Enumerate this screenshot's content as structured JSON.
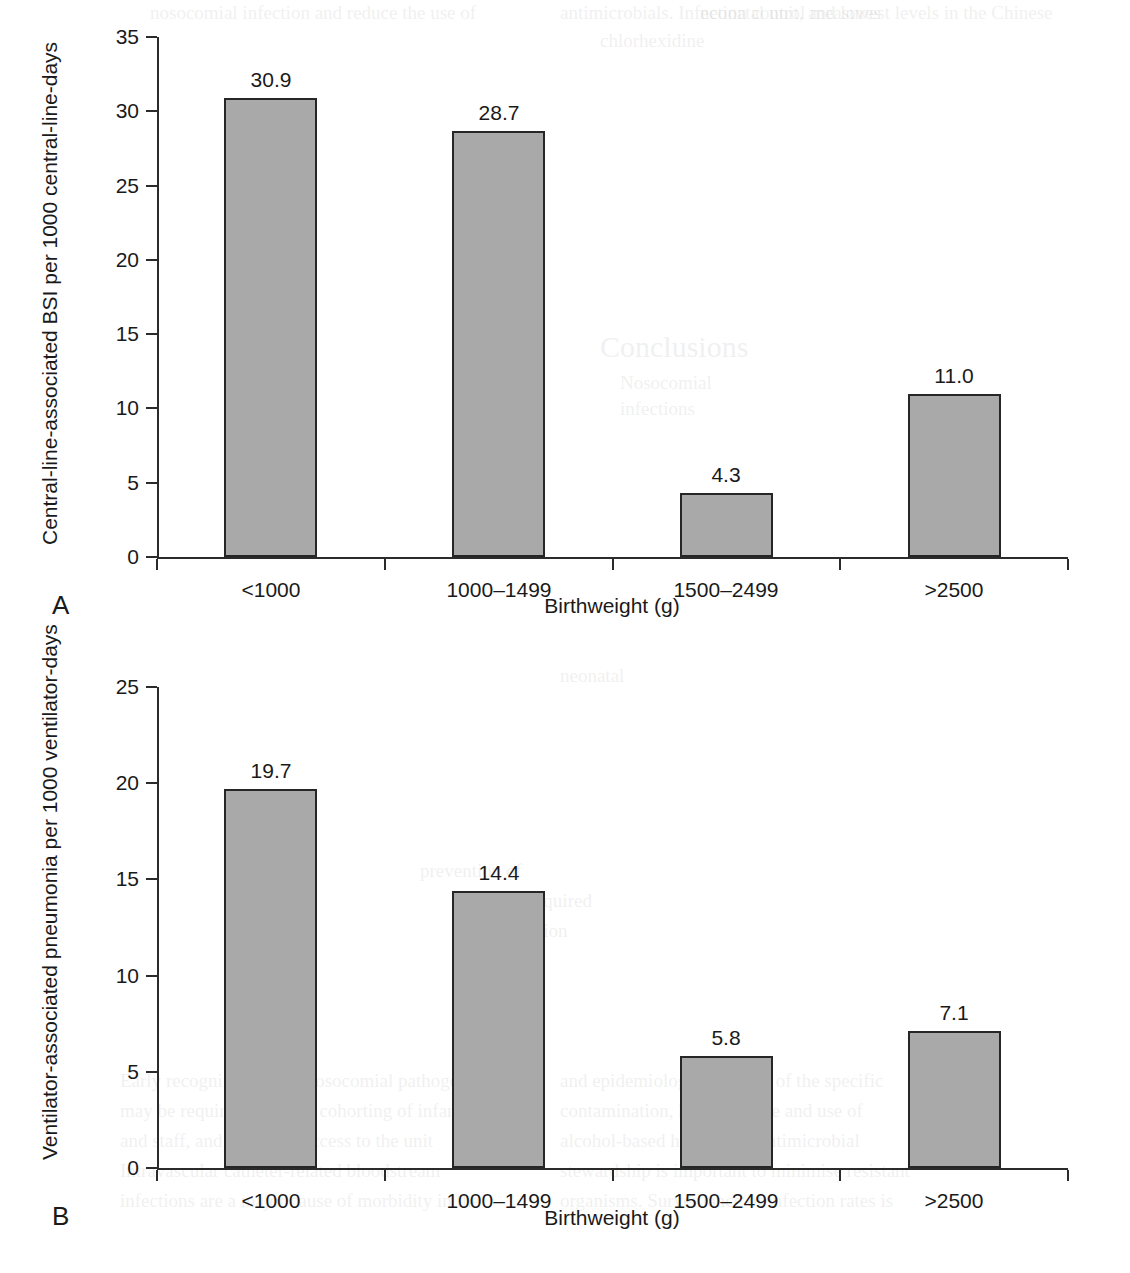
{
  "figure": {
    "panels": [
      {
        "letter": "A",
        "xlabel": "Birthweight (g)",
        "ylabel": "Central-line-associated BSI per 1000 central-line-days"
      },
      {
        "letter": "B",
        "xlabel": "Birthweight (g)",
        "ylabel": "Ventilator-associated pneumonia per 1000 ventilator-days"
      }
    ]
  },
  "chart_data": [
    {
      "type": "bar",
      "panel": "A",
      "title": "",
      "xlabel": "Birthweight (g)",
      "ylabel": "Central-line-associated BSI per 1000 central-line-days",
      "categories": [
        "<1000",
        "1000–1499",
        "1500–2499",
        ">2500"
      ],
      "values": [
        30.9,
        28.7,
        4.3,
        11.0
      ],
      "value_labels": [
        "30.9",
        "28.7",
        "4.3",
        "11.0"
      ],
      "ylim": [
        0,
        35
      ],
      "yticks": [
        0,
        5,
        10,
        15,
        20,
        25,
        30,
        35
      ],
      "ytick_labels": [
        "0",
        "5",
        "10",
        "15",
        "20",
        "25",
        "30",
        "35"
      ],
      "grid": false,
      "legend": null,
      "bar_color": "#a9a9a9",
      "bar_edge_color": "#262626"
    },
    {
      "type": "bar",
      "panel": "B",
      "title": "",
      "xlabel": "Birthweight (g)",
      "ylabel": "Ventilator-associated pneumonia per 1000 ventilator-days",
      "categories": [
        "<1000",
        "1000–1499",
        "1500–2499",
        ">2500"
      ],
      "values": [
        19.7,
        14.4,
        5.8,
        7.1
      ],
      "value_labels": [
        "19.7",
        "14.4",
        "5.8",
        "7.1"
      ],
      "ylim": [
        0,
        25
      ],
      "yticks": [
        0,
        5,
        10,
        15,
        20,
        25
      ],
      "ytick_labels": [
        "0",
        "5",
        "10",
        "15",
        "20",
        "25"
      ],
      "grid": false,
      "legend": null,
      "bar_color": "#a9a9a9",
      "bar_edge_color": "#262626"
    }
  ],
  "background_showthrough": [
    {
      "text": "nosocomial infection and reduce the use of",
      "x": 150,
      "y": 2,
      "size": 19
    },
    {
      "text": "antimicrobials. Infection control measures",
      "x": 560,
      "y": 2,
      "size": 19
    },
    {
      "text": "neonatal unit, and lowest levels in the Chinese",
      "x": 700,
      "y": 2,
      "size": 19
    },
    {
      "text": "chlorhexidine",
      "x": 600,
      "y": 30,
      "size": 19
    },
    {
      "text": "Conclusions",
      "x": 600,
      "y": 330,
      "size": 30
    },
    {
      "text": "Nosocomial",
      "x": 620,
      "y": 372,
      "size": 19
    },
    {
      "text": "infections",
      "x": 620,
      "y": 398,
      "size": 19
    },
    {
      "text": "neonatal",
      "x": 560,
      "y": 665,
      "size": 19
    },
    {
      "text": "prevention of",
      "x": 420,
      "y": 860,
      "size": 19
    },
    {
      "text": "hospital-acquired",
      "x": 460,
      "y": 890,
      "size": 19
    },
    {
      "text": "infection",
      "x": 500,
      "y": 920,
      "size": 19
    },
    {
      "text": "Early recognition of the nosocomial pathogen",
      "x": 120,
      "y": 1070,
      "size": 19
    },
    {
      "text": "and epidemiological review of the specific",
      "x": 560,
      "y": 1070,
      "size": 19
    },
    {
      "text": "may be required, with the cohorting of infants",
      "x": 120,
      "y": 1100,
      "size": 19
    },
    {
      "text": "contamination, hand hygiene and use of",
      "x": 560,
      "y": 1100,
      "size": 19
    },
    {
      "text": "and staff, and restricted access to the unit",
      "x": 120,
      "y": 1130,
      "size": 19
    },
    {
      "text": "alcohol-based hand rubs. Antimicrobial",
      "x": 560,
      "y": 1130,
      "size": 19
    },
    {
      "text": "Intravascular catheter-related bloodstream",
      "x": 120,
      "y": 1160,
      "size": 19
    },
    {
      "text": "stewardship is important to minimise resistant",
      "x": 560,
      "y": 1160,
      "size": 19
    },
    {
      "text": "infections are a major cause of morbidity in the",
      "x": 120,
      "y": 1190,
      "size": 19
    },
    {
      "text": "organisms. Surveillance of infection rates is",
      "x": 560,
      "y": 1190,
      "size": 19
    }
  ]
}
